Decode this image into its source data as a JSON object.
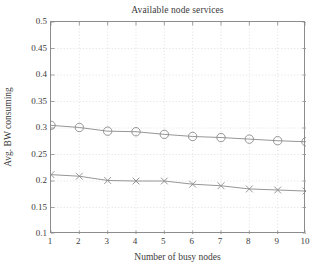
{
  "chart_data": {
    "type": "line",
    "title": "Available node services",
    "xlabel": "Number of busy nodes",
    "ylabel": "Avg. BW consuming",
    "x": [
      1,
      2,
      3,
      4,
      5,
      6,
      7,
      8,
      9,
      10
    ],
    "xlim": [
      1,
      10
    ],
    "ylim": [
      0.1,
      0.5
    ],
    "xticks": [
      1,
      2,
      3,
      4,
      5,
      6,
      7,
      8,
      9,
      10
    ],
    "xtick_labels": [
      "1",
      "2",
      "3",
      "4",
      "5",
      "6",
      "7",
      "8",
      "9",
      "10"
    ],
    "yticks": [
      0.1,
      0.15,
      0.2,
      0.25,
      0.3,
      0.35,
      0.4,
      0.45,
      0.5
    ],
    "ytick_labels": [
      "0.1",
      "0.15",
      "0.2",
      "0.25",
      "0.3",
      "0.35",
      "0.4",
      "0.45",
      "0.5"
    ],
    "grid": true,
    "grid_style": "dotted",
    "grid_color": "#d8d8d8",
    "legend": null,
    "legend_position": "none",
    "series": [
      {
        "name": "series-circle",
        "marker": "circle",
        "color": "#8a8a8a",
        "values": [
          0.305,
          0.301,
          0.294,
          0.293,
          0.288,
          0.284,
          0.282,
          0.279,
          0.276,
          0.274
        ]
      },
      {
        "name": "series-cross",
        "marker": "x",
        "color": "#8a8a8a",
        "values": [
          0.212,
          0.209,
          0.201,
          0.2,
          0.2,
          0.194,
          0.191,
          0.185,
          0.183,
          0.181
        ]
      }
    ],
    "axis_color": "#8c8c8c",
    "background": "#ffffff"
  }
}
